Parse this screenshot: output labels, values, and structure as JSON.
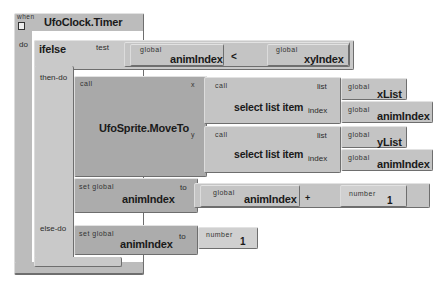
{
  "event": {
    "when_label": "when",
    "name": "UfoClock.Timer",
    "do_label": "do"
  },
  "ifelse": {
    "name": "ifelse",
    "test_label": "test",
    "then_label": "then-do",
    "else_label": "else-do",
    "test": {
      "left": {
        "prefix": "global",
        "name": "animIndex"
      },
      "operator": "<",
      "right": {
        "prefix": "global",
        "name": "xyIndex"
      }
    }
  },
  "moveto": {
    "call_label": "call",
    "name": "UfoSprite.MoveTo",
    "x_label": "x",
    "y_label": "y",
    "x_arg": {
      "call_label": "call",
      "name": "select list item",
      "list_label": "list",
      "index_label": "index",
      "list": {
        "prefix": "global",
        "name": "xList"
      },
      "index": {
        "prefix": "global",
        "name": "animIndex"
      }
    },
    "y_arg": {
      "call_label": "call",
      "name": "select list item",
      "list_label": "list",
      "index_label": "index",
      "list": {
        "prefix": "global",
        "name": "yList"
      },
      "index": {
        "prefix": "global",
        "name": "animIndex"
      }
    }
  },
  "set_increment": {
    "prefix": "set global",
    "name": "animIndex",
    "to_label": "to",
    "left": {
      "prefix": "global",
      "name": "animIndex"
    },
    "operator": "+",
    "right": {
      "prefix": "number",
      "value": "1"
    }
  },
  "set_reset": {
    "prefix": "set global",
    "name": "animIndex",
    "to_label": "to",
    "value": {
      "prefix": "number",
      "value": "1"
    }
  }
}
